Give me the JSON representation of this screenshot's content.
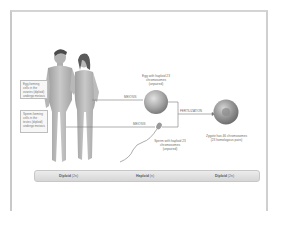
{
  "diagram": {
    "labels": {
      "egg_forming_cells": "Egg-forming cells in the ovaries (diploid) undergo meiosis",
      "sperm_forming_cells": "Sperm-forming cells in the testes (diploid) undergo meiosis",
      "egg": "Egg with haploid 23 chromosomes (unpaired)",
      "sperm": "Sperm with haploid 23 chromosomes (unpaired)",
      "zygote": "Zygote has 46 chromosomes (23 homologous pairs)",
      "meiosis_top": "MEIOSIS",
      "meiosis_bottom": "MEIOSIS",
      "fertilization": "FERTILIZATION"
    },
    "stages": [
      {
        "name": "Diploid",
        "value": "(2n)"
      },
      {
        "name": "Haploid",
        "value": "(n)"
      },
      {
        "name": "Diploid",
        "value": "(2n)"
      }
    ],
    "colors": {
      "frame": "#cccccc",
      "figure_fill": "#bdbdbd",
      "hair": "#4a4a4a",
      "egg_fill": "#a8a8a8",
      "zygote_fill": "#9a9a9a",
      "line": "#7a7a7a",
      "bar": "#e0e0e0"
    }
  }
}
